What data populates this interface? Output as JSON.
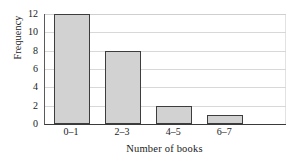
{
  "chart_data": {
    "type": "bar",
    "title": "",
    "subtitle": "",
    "categories": [
      "0–1",
      "2–3",
      "4–5",
      "6–7"
    ],
    "values": [
      12,
      8,
      2,
      1
    ],
    "xlabel": "Number of books",
    "ylabel": "Frequency",
    "ylim": [
      0,
      12
    ],
    "yticks": [
      0,
      2,
      4,
      6,
      8,
      10,
      12
    ],
    "ytick_labels": [
      "0",
      "2",
      "4",
      "6",
      "8",
      "10",
      "12"
    ],
    "grid": "horizontal",
    "legend": "none",
    "annotations": [],
    "series": [
      {
        "name": "Frequency",
        "values": [
          12,
          8,
          2,
          1
        ]
      }
    ]
  },
  "style": {
    "bar_fill": "#d2d2d2",
    "bar_stroke": "#3d3d3d",
    "grid_color": "#d8d8d8",
    "axis_color": "#3a3a3a",
    "background": "#ffffff",
    "text_color": "#1a1a1a"
  }
}
